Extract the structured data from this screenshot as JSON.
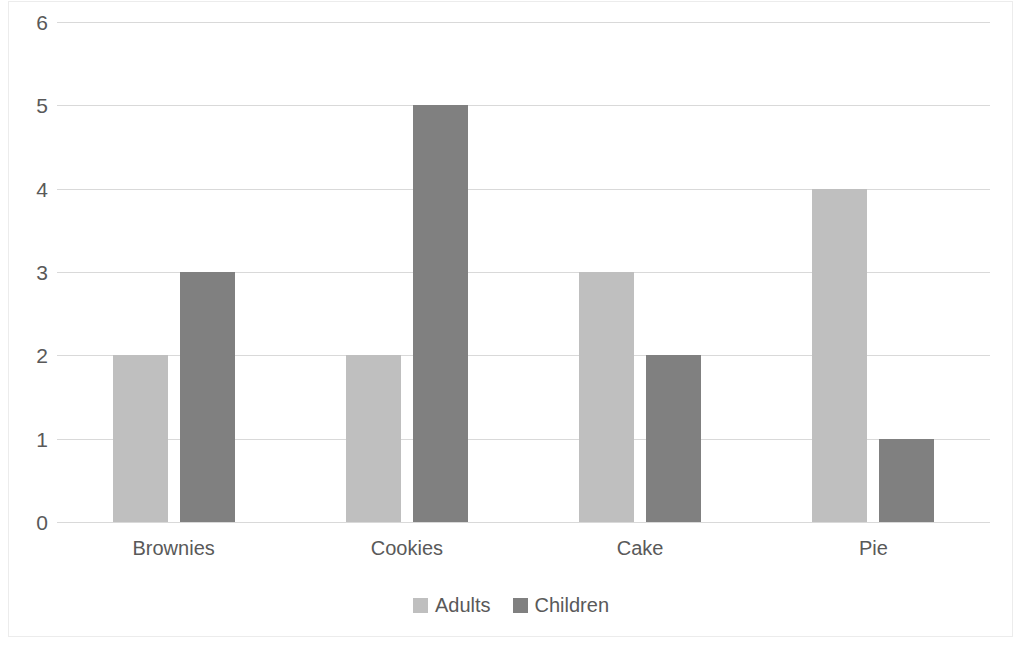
{
  "chart_data": {
    "type": "bar",
    "title": "",
    "subtitle": "",
    "xlabel": "",
    "ylabel": "",
    "categories": [
      "Brownies",
      "Cookies",
      "Cake",
      "Pie"
    ],
    "series": [
      {
        "name": "Adults",
        "color": "#bfbfbf",
        "values": [
          2,
          2,
          3,
          4
        ]
      },
      {
        "name": "Children",
        "color": "#808080",
        "values": [
          3,
          5,
          2,
          1
        ]
      }
    ],
    "ylim": [
      0,
      6
    ],
    "y_ticks": [
      0,
      1,
      2,
      3,
      4,
      5,
      6
    ],
    "y_tick_labels": [
      "0",
      "1",
      "2",
      "3",
      "4",
      "5",
      "6"
    ],
    "grid": true,
    "grid_axis": "y",
    "grid_color": "#d9d9d9",
    "legend": {
      "position": "bottom",
      "entries": [
        {
          "label": "Adults",
          "color": "#bfbfbf"
        },
        {
          "label": "Children",
          "color": "#808080"
        }
      ]
    },
    "background_color": "#ffffff",
    "border_color": "#ececec",
    "tick_label_color": "#595959"
  }
}
